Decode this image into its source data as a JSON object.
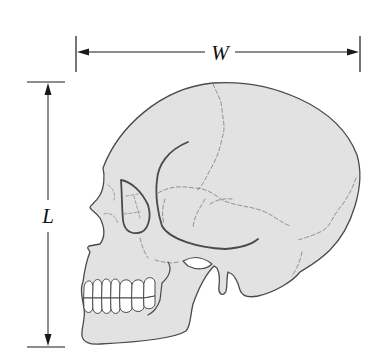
{
  "figure": {
    "dimensions": [
      {
        "id": "width",
        "label": "W",
        "orientation": "horizontal"
      },
      {
        "id": "length",
        "label": "L",
        "orientation": "vertical"
      }
    ]
  },
  "colors": {
    "skull_fill": "#e2e2e2",
    "outline": "#4a4a4a",
    "suture": "#7a7a7a",
    "teeth_fill": "#ffffff",
    "dimension_lines": "#1a1a1a"
  }
}
